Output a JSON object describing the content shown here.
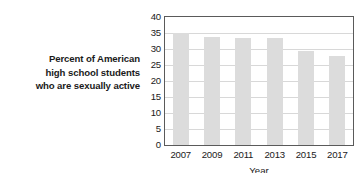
{
  "chart_data": {
    "type": "bar",
    "title": "",
    "categories": [
      "2007",
      "2009",
      "2011",
      "2013",
      "2015",
      "2017"
    ],
    "values": [
      35.0,
      33.9,
      33.4,
      33.5,
      29.5,
      27.8
    ],
    "series": [
      {
        "name": "Percent of American high school students who are sexually active",
        "values": [
          35.0,
          33.9,
          33.4,
          33.5,
          29.5,
          27.8
        ]
      }
    ],
    "xlabel": "Year",
    "ylabel": "Percent of American high school students who are sexually active",
    "ylim": [
      0,
      40
    ],
    "ytick_values": [
      0,
      5,
      10,
      15,
      20,
      25,
      30,
      35,
      40
    ],
    "ytick_labels": [
      "0",
      "5",
      "10",
      "15",
      "20",
      "25",
      "30",
      "35",
      "40"
    ],
    "ytick_step": 5,
    "grid": true,
    "grid_axis": "y",
    "legend": false,
    "legend_position": "none",
    "bar_color": "#dcdcdc",
    "grid_color": "#d8d8d8",
    "frame_color": "#5a5a5a",
    "text_color": "#1a1a1a",
    "background": "#ffffff"
  },
  "y_axis_label_lines": [
    "Percent of American",
    "high school students",
    "who are sexually active"
  ]
}
